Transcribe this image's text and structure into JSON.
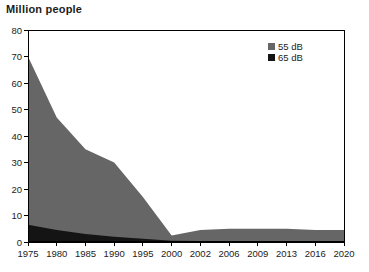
{
  "title": "Million people",
  "legend": {
    "items": [
      {
        "label": "55 dB",
        "color": "#666666"
      },
      {
        "label": "65 dB",
        "color": "#141414"
      }
    ]
  },
  "colors": {
    "background": "#ffffff",
    "axis": "#000000",
    "text": "#1c1c1c",
    "area_55db": "#666666",
    "area_65db": "#141414"
  },
  "chart_data": {
    "type": "area",
    "title": "Million people",
    "xlabel": "",
    "ylabel": "Million people",
    "categories": [
      "1975",
      "1980",
      "1985",
      "1990",
      "1995",
      "2000",
      "2002",
      "2006",
      "2009",
      "2013",
      "2016",
      "2020"
    ],
    "series": [
      {
        "name": "55 dB",
        "color": "#666666",
        "values": [
          70,
          47,
          35,
          30,
          17,
          2.5,
          4.5,
          5,
          5,
          5,
          4.5,
          4.5
        ]
      },
      {
        "name": "65 dB",
        "color": "#141414",
        "values": [
          6.5,
          4.5,
          3,
          2,
          1.2,
          0.5,
          0.4,
          0.4,
          0.4,
          0.4,
          0.4,
          0.4
        ]
      }
    ],
    "ylim": [
      0,
      80
    ],
    "yticks": [
      0,
      10,
      20,
      30,
      40,
      50,
      60,
      70,
      80
    ],
    "grid": false,
    "overlapping_areas": true,
    "legend_position": "top-right"
  }
}
